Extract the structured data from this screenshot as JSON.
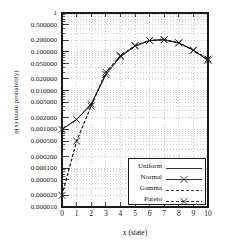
{
  "chart_data": {
    "type": "line",
    "title": "",
    "xlabel": "x (state)",
    "ylabel": "p(x) (state probability)",
    "xlim": [
      0,
      10
    ],
    "ylim": [
      1e-05,
      1
    ],
    "yscale": "log",
    "grid": true,
    "legend_position": "lower right",
    "x": [
      0,
      1,
      2,
      3,
      4,
      5,
      6,
      7,
      8,
      9,
      10
    ],
    "xticklabels": [
      "0",
      "1",
      "2",
      "3",
      "4",
      "5",
      "6",
      "7",
      "8",
      "9",
      "10"
    ],
    "yticklabels": [
      "1",
      "0.500000",
      "0.200000",
      "0.100000",
      "0.050000",
      "0.020000",
      "0.010000",
      "0.005000",
      "0.002000",
      "0.001000",
      "0.000500",
      "0.000200",
      "0.000100",
      "0.000050",
      "0.000020",
      "0.000010"
    ],
    "ytickvalues": [
      1,
      0.5,
      0.2,
      0.1,
      0.05,
      0.02,
      0.01,
      0.005,
      0.002,
      0.001,
      0.0005,
      0.0002,
      0.0001,
      5e-05,
      2e-05,
      1e-05
    ],
    "series": [
      {
        "name": "Uniform",
        "style": "solid",
        "marker": "none",
        "values": [
          0.001,
          0.0018,
          0.0045,
          0.026,
          0.075,
          0.14,
          0.195,
          0.205,
          0.17,
          0.11,
          0.06
        ]
      },
      {
        "name": "Normal",
        "style": "solid",
        "marker": "x",
        "values": [
          0.001,
          0.0018,
          0.0045,
          0.026,
          0.075,
          0.14,
          0.195,
          0.205,
          0.17,
          0.11,
          0.06
        ]
      },
      {
        "name": "Gamma",
        "style": "dashed",
        "marker": "none",
        "values": [
          2e-05,
          0.0005,
          0.004,
          0.03,
          0.08,
          0.145,
          0.195,
          0.205,
          0.17,
          0.11,
          0.065
        ]
      },
      {
        "name": "Pareto",
        "style": "dashed",
        "marker": "x",
        "values": [
          2e-05,
          0.0005,
          0.004,
          0.03,
          0.08,
          0.145,
          0.195,
          0.205,
          0.17,
          0.11,
          0.065
        ]
      }
    ]
  },
  "legend": {
    "items": [
      {
        "label": "Uniform"
      },
      {
        "label": "Normal"
      },
      {
        "label": "Gamma"
      },
      {
        "label": "Pareto"
      }
    ]
  },
  "colors": {
    "axis": "#1a1a1a",
    "grid": "#9a9a9a",
    "line": "#1a1a1a",
    "background": "#ffffff"
  }
}
